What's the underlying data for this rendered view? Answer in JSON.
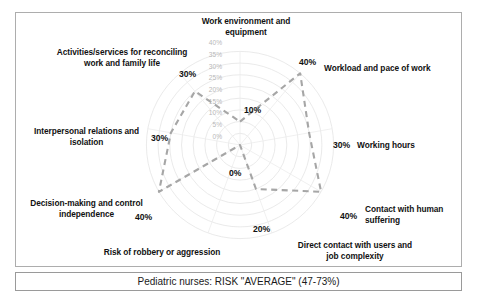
{
  "caption": {
    "text": "Pediatric nurses: RISK \"AVERAGE\" (47-73%)"
  },
  "chart_data": {
    "type": "radar",
    "title": "",
    "subtitle": "",
    "xlabel": "",
    "ylabel": "",
    "grid": true,
    "legend_position": "none",
    "rlim": [
      0,
      40
    ],
    "r_tick_labels": [
      "0%",
      "5%",
      "10%",
      "15%",
      "20%",
      "25%",
      "30%",
      "35%",
      "40%"
    ],
    "r_ticks": [
      0,
      5,
      10,
      15,
      20,
      25,
      30,
      35,
      40
    ],
    "series_color": "#a6a6a6",
    "grid_color": "#e2e2e2",
    "categories": [
      "Work environment and equipment",
      "Workload and pace of work",
      "Working hours",
      "Contact with human suffering",
      "Direct contact with users and job complexity",
      "Risk of robbery or aggression",
      "Decision-making and control independence",
      "Interpersonal relations and isolation",
      "Activities/services for reconciling work and family life"
    ],
    "values": [
      10,
      40,
      30,
      40,
      20,
      0,
      40,
      30,
      30
    ],
    "data_labels": [
      "10%",
      "40%",
      "30%",
      "40%",
      "20%",
      "0%",
      "40%",
      "30%",
      "30%"
    ],
    "series": [
      {
        "name": "Pediatric nurses",
        "values": [
          10,
          40,
          30,
          40,
          20,
          0,
          40,
          30,
          30
        ]
      }
    ]
  },
  "axes": [
    {
      "name": "work-environment",
      "label": "Work environment and equipment",
      "value_label": "10%"
    },
    {
      "name": "workload-pace",
      "label": "Workload and pace of work",
      "value_label": "40%"
    },
    {
      "name": "working-hours",
      "label": "Working hours",
      "value_label": "30%"
    },
    {
      "name": "contact-human-suffering",
      "label": "Contact with human suffering",
      "value_label": "40%"
    },
    {
      "name": "direct-contact-users",
      "label": "Direct contact with users and job complexity",
      "value_label": "20%"
    },
    {
      "name": "risk-robbery",
      "label": "Risk of robbery or aggression",
      "value_label": "0%"
    },
    {
      "name": "decision-making",
      "label": "Decision-making and control independence",
      "value_label": "40%"
    },
    {
      "name": "interpersonal-relations",
      "label": "Interpersonal relations and isolation",
      "value_label": "30%"
    },
    {
      "name": "activities-services",
      "label": "Activities/services for reconciling work and family life",
      "value_label": "30%"
    }
  ],
  "ticks": {
    "t40": "40%",
    "t35": "35%",
    "t30": "30%",
    "t25": "25%",
    "t20": "20%",
    "t15": "15%",
    "t10": "10%",
    "t5": "5%",
    "t0": "0%"
  }
}
